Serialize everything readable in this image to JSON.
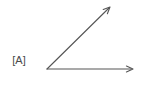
{
  "figure": {
    "kind": "angle-diagram",
    "label": "[A]",
    "background_color": "#ffffff",
    "stroke_color": "#555555",
    "label_color": "#4a4a4a",
    "canvas": {
      "width": 153,
      "height": 107
    },
    "vertex": {
      "x": 47,
      "y": 69
    },
    "rays": [
      {
        "name": "horizontal-ray",
        "from": {
          "x": 47,
          "y": 69
        },
        "to": {
          "x": 133,
          "y": 69
        },
        "arrowhead": "open-chevron",
        "direction_degrees": 0
      },
      {
        "name": "diagonal-ray",
        "from": {
          "x": 47,
          "y": 69
        },
        "to": {
          "x": 110,
          "y": 7
        },
        "arrowhead": "open-chevron",
        "direction_degrees": 45
      }
    ],
    "angle_degrees": 45
  }
}
